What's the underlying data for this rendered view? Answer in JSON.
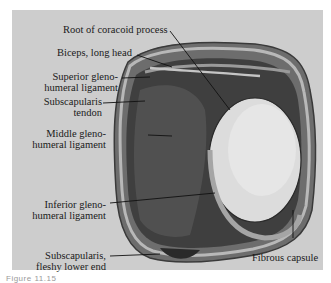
{
  "figure": {
    "background_color": "#cdcdcd",
    "labels": {
      "root_coracoid": "Root of coracoid process",
      "biceps_long_head": "Biceps, long head",
      "superior_gh_1": "Superior gleno-",
      "superior_gh_2": "humeral ligament",
      "subscap_tendon_1": "Subscapularis",
      "subscap_tendon_2": "tendon",
      "middle_gh_1": "Middle gleno-",
      "middle_gh_2": "humeral ligament",
      "inferior_gh_1": "Inferior gleno-",
      "inferior_gh_2": "humeral ligament",
      "subscap_lower_1": "Subscapularis,",
      "subscap_lower_2": "fleshy lower end",
      "fibrous_capsule": "Fibrous capsule"
    },
    "caption": "Figure 11.15"
  }
}
